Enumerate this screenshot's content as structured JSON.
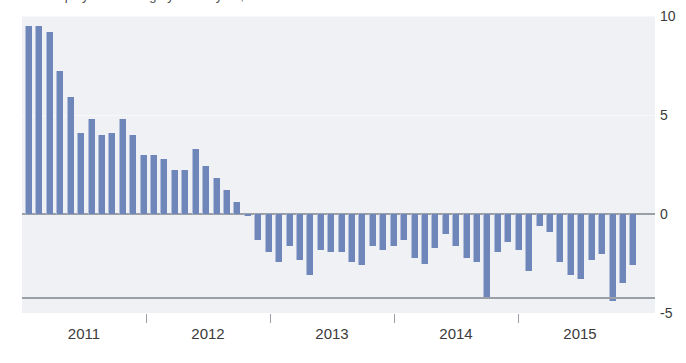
{
  "title_sliver": "Unemployment change year-on-year, in thousands",
  "colors": {
    "bar": "#6f86bb",
    "plot_background": "#eff1f4",
    "axis": "#9aa0a6",
    "gridline": "#f7f8fa",
    "text": "#3b3b3b"
  },
  "axis": {
    "y_ticks": [
      {
        "label": "10",
        "value": 10
      },
      {
        "label": "5",
        "value": 5
      },
      {
        "label": "0",
        "value": 0
      },
      {
        "label": "-5",
        "value": -5
      }
    ],
    "x_labels": [
      "2011",
      "2012",
      "2013",
      "2014",
      "2015"
    ]
  },
  "chart_data": {
    "type": "bar",
    "title": "Unemployment change year-on-year, in thousands",
    "xlabel": "",
    "ylabel": "",
    "ylim": [
      -5,
      10
    ],
    "grid": true,
    "legend": "none",
    "orientation": "vertical",
    "categories": [
      "2011-01",
      "2011-02",
      "2011-03",
      "2011-04",
      "2011-05",
      "2011-06",
      "2011-07",
      "2011-08",
      "2011-09",
      "2011-10",
      "2011-11",
      "2011-12",
      "2012-01",
      "2012-02",
      "2012-03",
      "2012-04",
      "2012-05",
      "2012-06",
      "2012-07",
      "2012-08",
      "2012-09",
      "2012-10",
      "2012-11",
      "2012-12",
      "2013-01",
      "2013-02",
      "2013-03",
      "2013-04",
      "2013-05",
      "2013-06",
      "2013-07",
      "2013-08",
      "2013-09",
      "2013-10",
      "2013-11",
      "2013-12",
      "2014-01",
      "2014-02",
      "2014-03",
      "2014-04",
      "2014-05",
      "2014-06",
      "2014-07",
      "2014-08",
      "2014-09",
      "2014-10",
      "2014-11",
      "2014-12",
      "2015-01",
      "2015-02",
      "2015-03",
      "2015-04",
      "2015-05",
      "2015-06",
      "2015-07",
      "2015-08",
      "2015-09",
      "2015-10",
      "2015-11"
    ],
    "values": [
      9.5,
      9.5,
      9.2,
      7.2,
      5.9,
      4.1,
      4.8,
      4.0,
      4.1,
      4.8,
      4.0,
      3.0,
      3.0,
      2.8,
      2.2,
      2.2,
      3.3,
      2.4,
      1.8,
      1.2,
      0.6,
      -0.1,
      -1.3,
      -1.9,
      -2.4,
      -1.6,
      -2.3,
      -3.1,
      -1.8,
      -1.9,
      -1.9,
      -2.4,
      -2.6,
      -1.6,
      -1.8,
      -1.6,
      -1.3,
      -2.2,
      -2.5,
      -1.7,
      -1.0,
      -1.6,
      -2.2,
      -2.4,
      -4.2,
      -1.9,
      -1.4,
      -1.8,
      -2.9,
      -0.6,
      -0.9,
      -2.4,
      -3.1,
      -3.3,
      -2.3,
      -2.0,
      -4.4,
      -3.5,
      -2.6
    ]
  }
}
